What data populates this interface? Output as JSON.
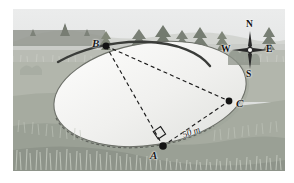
{
  "figure": {
    "border_color": "#ffffff"
  },
  "scene": {
    "sky_top_color": "#e9eaea",
    "sky_bottom_color": "#d6d8d6",
    "hill_color": "#c8cac6",
    "treeline_color": "#8f938c",
    "tree_color": "#7d8279",
    "far_field_color": "#bfc2ba",
    "mid_field_color": "#b4b8ae",
    "near_field_color": "#a9ada3",
    "foreground_color": "#9ba097",
    "grass_tuft_color": "#c9cdc4",
    "water_fill_color": "#f1f1ef",
    "water_edge_color": "#3d3f3d",
    "shadow_color": "#9da199"
  },
  "geometry": {
    "points": [
      {
        "id": "A",
        "label": "A",
        "x": 163,
        "y": 146,
        "label_x": 150,
        "label_y": 150
      },
      {
        "id": "B",
        "label": "B",
        "x": 106,
        "y": 46,
        "label_x": 92,
        "label_y": 41
      },
      {
        "id": "C",
        "label": "C",
        "x": 229,
        "y": 101,
        "label_x": 236,
        "label_y": 103
      }
    ],
    "edges": [
      {
        "from": "B",
        "to": "C",
        "style": "dashed"
      },
      {
        "from": "B",
        "to": "A",
        "style": "dashed"
      },
      {
        "from": "A",
        "to": "C",
        "style": "dashed"
      }
    ],
    "right_angle": {
      "at": "A",
      "marker": "square"
    },
    "measurements": [
      {
        "label": "50 m",
        "value": 50,
        "unit": "m",
        "edge": "A-C",
        "x": 186,
        "y": 130,
        "rotation_deg": -20
      }
    ]
  },
  "compass": {
    "name": "compass-rose",
    "center_x": 250,
    "center_y": 50,
    "directions": [
      {
        "id": "N",
        "label": "N",
        "x": 247,
        "y": 24
      },
      {
        "id": "W",
        "label": "W",
        "x": 225,
        "y": 45
      },
      {
        "id": "E",
        "label": "E",
        "x": 266,
        "y": 45
      },
      {
        "id": "S",
        "label": "S",
        "x": 247,
        "y": 68
      }
    ]
  }
}
